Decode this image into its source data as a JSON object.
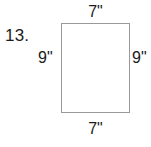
{
  "figure": {
    "problem_number": "13.",
    "shape": "rectangle",
    "labels": {
      "top": "7\"",
      "bottom": "7\"",
      "left": "9\"",
      "right": "9\""
    },
    "colors": {
      "stroke": "#9a9a9a",
      "text": "#1b1b1b",
      "background": "#ffffff",
      "fill": "#ffffff"
    }
  }
}
